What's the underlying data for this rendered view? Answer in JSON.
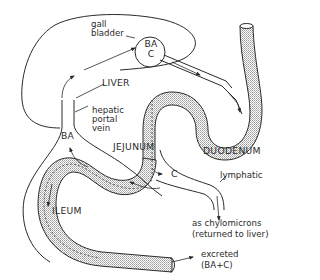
{
  "diagram": {
    "colors": {
      "line": "#2a2a2a",
      "background": "#ffffff",
      "intestine_fill": "#d9d9d9"
    },
    "labels": {
      "gall_bladder_line1": "gall",
      "gall_bladder_line2": "bladder",
      "gb_contents_line1": "BA",
      "gb_contents_line2": "C",
      "liver": "LIVER",
      "hepatic_portal_line1": "hepatic",
      "hepatic_portal_line2": "portal",
      "hepatic_portal_line3": "vein",
      "ba_return": "BA",
      "jejunum": "JEJUNUM",
      "duodenum": "DUODENUM",
      "c_absorbed": "C",
      "lymphatic": "lymphatic",
      "ileum": "ILEUM",
      "chylomicrons_line1": "as chylomicrons",
      "chylomicrons_line2": "(returned to liver)",
      "excreted_line1": "excreted",
      "excreted_line2": "(BA+C)"
    },
    "structures": [
      "liver-outline",
      "gall-bladder",
      "bile-duct",
      "duodenum",
      "jejunum",
      "ileum",
      "hepatic-portal-vein",
      "lymphatic-vessel"
    ]
  }
}
